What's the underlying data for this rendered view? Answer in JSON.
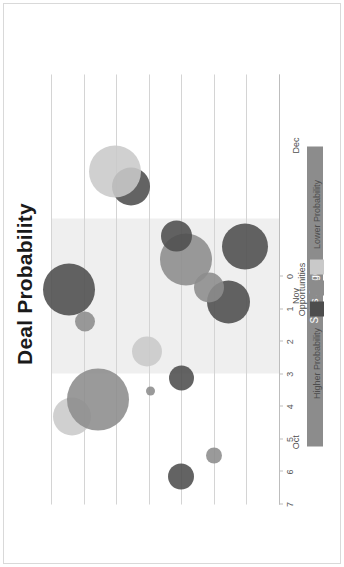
{
  "chart_data": {
    "type": "scatter",
    "title": "Deal Probability",
    "xlabel": "Opportunities",
    "ylabel": "Sales Stage",
    "ylim": [
      0,
      7
    ],
    "yticks": [
      "7",
      "6",
      "5",
      "4",
      "3",
      "2",
      "1",
      "0"
    ],
    "grid": true,
    "categories": [
      "Oct",
      "Nov",
      "Dec"
    ],
    "legend": {
      "title": "Opportunities",
      "position": "bottom",
      "high_label": "Higher Probability",
      "low_label": "Lower Probability",
      "swatches": [
        "#4d4d4d",
        "#8c8c8c",
        "#c9c9c9"
      ]
    },
    "highlight_band": {
      "label": "Nov",
      "start": 0.305,
      "end": 0.665,
      "color": "#efefef"
    },
    "colors": {
      "high": "#4d4d4d",
      "mid": "#8c8c8c",
      "low": "#c9c9c9",
      "grid": "#d4d4d4",
      "axis": "#bdbdbd",
      "title_text": "#1a1a1a",
      "axis_title_bar": "#8c8c8c",
      "axis_title_text": "#ffffff",
      "page_background": "#ffffff"
    },
    "points": [
      {
        "id": "p1",
        "month_pos": 0.065,
        "stage": 3.0,
        "size": 26,
        "probability": "high"
      },
      {
        "id": "p2",
        "month_pos": 0.115,
        "stage": 2.0,
        "size": 16,
        "probability": "mid"
      },
      {
        "id": "p3",
        "month_pos": 0.205,
        "stage": 6.35,
        "size": 38,
        "probability": "low"
      },
      {
        "id": "p4",
        "month_pos": 0.245,
        "stage": 5.55,
        "size": 62,
        "probability": "mid"
      },
      {
        "id": "p5",
        "month_pos": 0.265,
        "stage": 3.95,
        "size": 9,
        "probability": "mid"
      },
      {
        "id": "p6",
        "month_pos": 0.295,
        "stage": 3.0,
        "size": 25,
        "probability": "high"
      },
      {
        "id": "p7",
        "month_pos": 0.355,
        "stage": 4.05,
        "size": 30,
        "probability": "low"
      },
      {
        "id": "p8",
        "month_pos": 0.425,
        "stage": 5.95,
        "size": 20,
        "probability": "mid"
      },
      {
        "id": "p9",
        "month_pos": 0.47,
        "stage": 1.55,
        "size": 43,
        "probability": "high"
      },
      {
        "id": "p10",
        "month_pos": 0.5,
        "stage": 6.45,
        "size": 52,
        "probability": "high"
      },
      {
        "id": "p11",
        "month_pos": 0.505,
        "stage": 2.15,
        "size": 30,
        "probability": "mid"
      },
      {
        "id": "p12",
        "month_pos": 0.57,
        "stage": 2.85,
        "size": 52,
        "probability": "mid"
      },
      {
        "id": "p13",
        "month_pos": 0.6,
        "stage": 1.05,
        "size": 46,
        "probability": "high"
      },
      {
        "id": "p14",
        "month_pos": 0.625,
        "stage": 3.15,
        "size": 31,
        "probability": "high"
      },
      {
        "id": "p15",
        "month_pos": 0.74,
        "stage": 4.55,
        "size": 38,
        "probability": "high"
      },
      {
        "id": "p16",
        "month_pos": 0.775,
        "stage": 5.05,
        "size": 52,
        "probability": "low"
      }
    ]
  },
  "chart": {
    "title": "Deal Probability",
    "value_axis_title": "Sales Stage",
    "category_axis_title": "Opportunities",
    "tick_labels": [
      "7",
      "6",
      "5",
      "4",
      "3",
      "2",
      "1",
      "0"
    ],
    "category_labels": [
      "Oct",
      "Nov",
      "Dec"
    ],
    "legend_high": "Higher Probability",
    "legend_low": "Lower Probability"
  }
}
